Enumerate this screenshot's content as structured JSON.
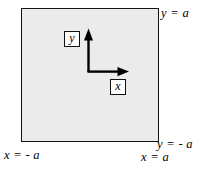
{
  "figure": {
    "background_color": "#ffffff"
  },
  "domain_region": {
    "name": "shaded-square",
    "fill_color": "#ebebeb",
    "stroke_color": "#141414",
    "x": 21,
    "y": 8,
    "width": 138,
    "height": 134
  },
  "axes": {
    "origin": {
      "x": 88,
      "y": 72
    },
    "stroke_color": "#000000",
    "y_axis": {
      "label": "y",
      "direction": "up",
      "tip_y": 29
    },
    "x_axis": {
      "label": "x",
      "direction": "right",
      "tip_x": 129
    }
  },
  "variable_labels": [
    {
      "id": "y",
      "text": "y"
    },
    {
      "id": "x",
      "text": "x"
    }
  ],
  "boundary_labels": [
    {
      "id": "y-eq-a",
      "text": "y = a",
      "position": "top-right"
    },
    {
      "id": "y-eq-neg-a",
      "text": "y = - a",
      "position": "bottom-right"
    },
    {
      "id": "x-eq-a",
      "text": "x = a",
      "position": "bottom-right-lower"
    },
    {
      "id": "x-eq-neg-a",
      "text": "x = - a",
      "position": "bottom-left"
    }
  ]
}
